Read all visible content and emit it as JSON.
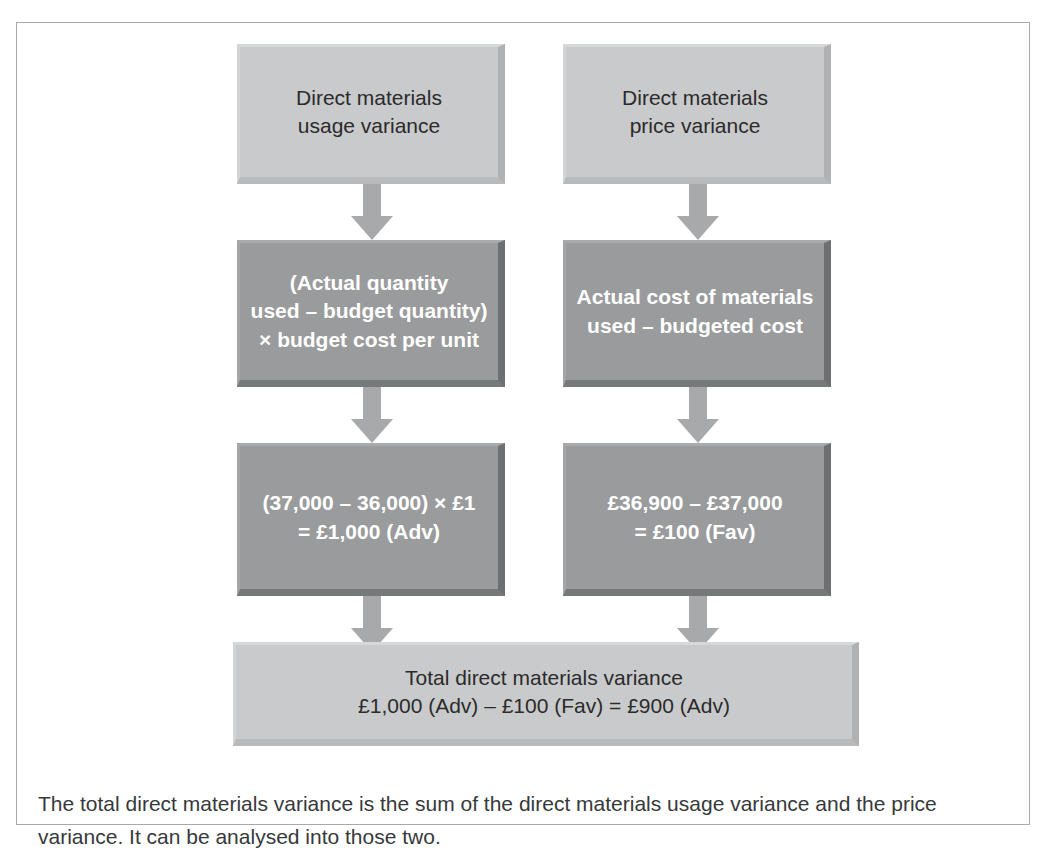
{
  "figure": {
    "type": "flow-diagram",
    "nodes": [
      {
        "id": "usage-variance",
        "row": 1,
        "column": "left",
        "style": "light",
        "text": "Direct materials\nusage variance"
      },
      {
        "id": "price-variance",
        "row": 1,
        "column": "right",
        "style": "light",
        "text": "Direct materials\nprice variance"
      },
      {
        "id": "usage-formula",
        "row": 2,
        "column": "left",
        "style": "dark",
        "text": "(Actual quantity\nused – budget quantity)\n× budget cost per unit"
      },
      {
        "id": "price-formula",
        "row": 2,
        "column": "right",
        "style": "dark",
        "text": "Actual cost of materials\nused – budgeted cost"
      },
      {
        "id": "usage-calculation",
        "row": 3,
        "column": "left",
        "style": "dark",
        "text": "(37,000 – 36,000) × £1\n= £1,000 (Adv)"
      },
      {
        "id": "price-calculation",
        "row": 3,
        "column": "right",
        "style": "dark",
        "text": "£36,900 – £37,000\n= £100 (Fav)"
      },
      {
        "id": "total-variance",
        "row": 4,
        "column": "full",
        "style": "light",
        "text": "Total direct materials variance\n£1,000 (Adv) –  £100 (Fav) = £900 (Adv)"
      }
    ],
    "arrows": [
      {
        "id": "arrow-left-1-2",
        "from": "usage-variance",
        "to": "usage-formula",
        "direction": "down"
      },
      {
        "id": "arrow-right-1-2",
        "from": "price-variance",
        "to": "price-formula",
        "direction": "down"
      },
      {
        "id": "arrow-left-2-3",
        "from": "usage-formula",
        "to": "usage-calculation",
        "direction": "down"
      },
      {
        "id": "arrow-right-2-3",
        "from": "price-formula",
        "to": "price-calculation",
        "direction": "down"
      },
      {
        "id": "arrow-left-3-4",
        "from": "usage-calculation",
        "to": "total-variance",
        "direction": "down"
      },
      {
        "id": "arrow-right-3-4",
        "from": "price-calculation",
        "to": "total-variance",
        "direction": "down"
      }
    ],
    "caption": "The total direct materials variance is the sum of the direct materials usage variance and the price variance. It can be analysed into those two.",
    "colors": {
      "light_box_fill": "#c9cacb",
      "dark_box_fill": "#9a9b9c",
      "arrow_fill": "#a8a9aa",
      "frame_border": "#a9a9aa",
      "light_box_text": "#2b2b2b",
      "dark_box_text": "#ffffff",
      "caption_text": "#37393b",
      "page_background": "#ffffff"
    }
  }
}
